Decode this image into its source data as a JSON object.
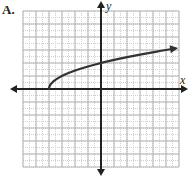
{
  "panel_label": "A.",
  "chart_data": {
    "type": "line",
    "title": "",
    "xlabel": "x",
    "ylabel": "y",
    "function": "y = sqrt(x + 4)",
    "xlim": [
      -6,
      6
    ],
    "ylim": [
      -6,
      6
    ],
    "grid": true,
    "grid_major_step": 1,
    "grid_minor_step": 0.5,
    "tick_labels": [],
    "legend": [],
    "series": [
      {
        "name": "curve",
        "start_point": [
          -4,
          0
        ],
        "arrow_end": true,
        "x": [
          -4,
          -3.75,
          -3.5,
          -3,
          -2,
          -1,
          0,
          1,
          2,
          3,
          4,
          5,
          5.7
        ],
        "y": [
          0,
          0.5,
          0.71,
          1,
          1.41,
          1.73,
          2,
          2.24,
          2.45,
          2.65,
          2.83,
          3,
          3.11
        ]
      }
    ]
  },
  "colors": {
    "axis": "#222222",
    "curve": "#333333",
    "grid_major": "#b4b4b4",
    "grid_minor": "#cfcfcf"
  }
}
